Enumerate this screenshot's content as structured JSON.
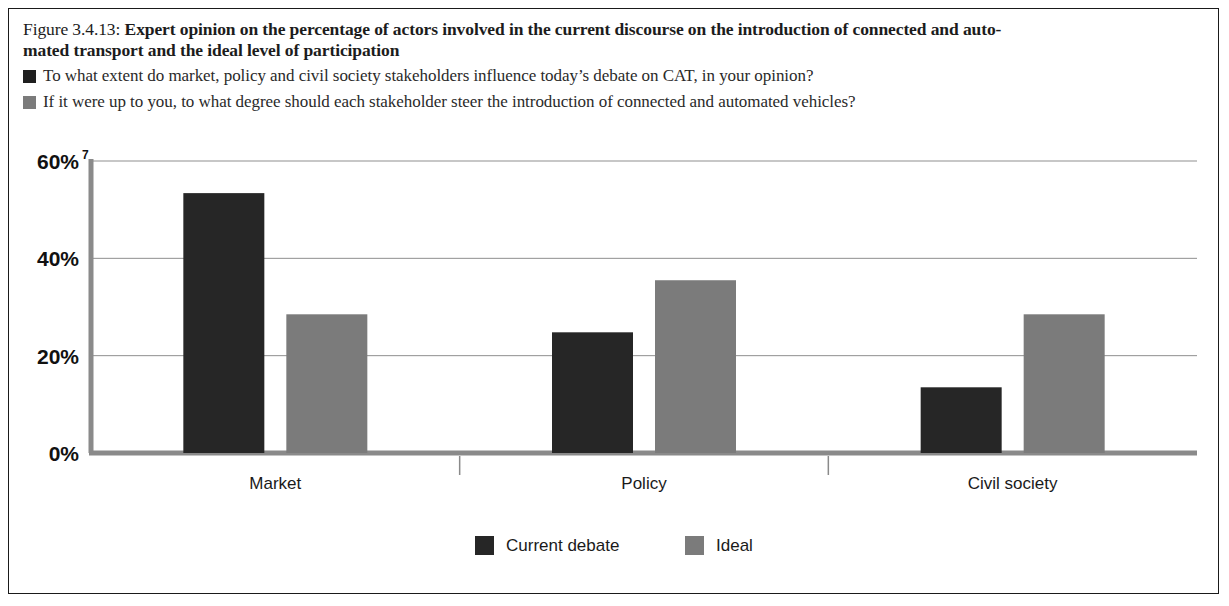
{
  "figure": {
    "number_prefix": "Figure 3.4.13: ",
    "title": "Expert opinion on the percentage of actors involved in the current discourse on the introduction of connected and auto-",
    "title_line2": "mated transport and the ideal level of participation"
  },
  "questions": [
    {
      "swatch": "dark",
      "color": "#1f1f1f",
      "text": "To what extent do market, policy and civil society stakeholders influence today’s debate on CAT, in your opinion?"
    },
    {
      "swatch": "light",
      "color": "#7b7b7b",
      "text": "If it were up to you, to what degree should each stakeholder steer the introduction of connected and automated vehicles?"
    }
  ],
  "chart_data": {
    "type": "bar",
    "categories": [
      "Market",
      "Policy",
      "Civil society"
    ],
    "series": [
      {
        "name": "Current debate",
        "color": "#262626",
        "values": [
          53.4,
          24.8,
          13.5
        ]
      },
      {
        "name": "Ideal",
        "color": "#7b7b7b",
        "values": [
          28.5,
          35.5,
          28.5
        ]
      }
    ],
    "ylim": [
      0,
      60
    ],
    "yticks": [
      0,
      20,
      40,
      60
    ],
    "ytick_labels": [
      "0%",
      "20%",
      "40%",
      "60%"
    ],
    "ytick_top_superscript": "7",
    "xlabel": "",
    "ylabel": "",
    "grid": true,
    "legend_position": "bottom"
  },
  "legend": [
    {
      "label": "Current debate",
      "color": "#262626"
    },
    {
      "label": "Ideal",
      "color": "#7b7b7b"
    }
  ]
}
